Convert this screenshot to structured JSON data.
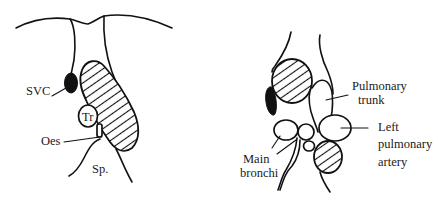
{
  "figure": {
    "left_panel": {
      "labels": {
        "svc": "SVC",
        "tr": "Tr",
        "oes": "Oes",
        "sp": "Sp."
      }
    },
    "right_panel": {
      "labels": {
        "pulmonary_trunk_line1": "Pulmonary",
        "pulmonary_trunk_line2": "trunk",
        "left_pulmonary_artery_line1": "Left",
        "left_pulmonary_artery_line2": "pulmonary",
        "left_pulmonary_artery_line3": "artery",
        "main_bronchi_line1": "Main",
        "main_bronchi_line2": "bronchi"
      }
    }
  }
}
